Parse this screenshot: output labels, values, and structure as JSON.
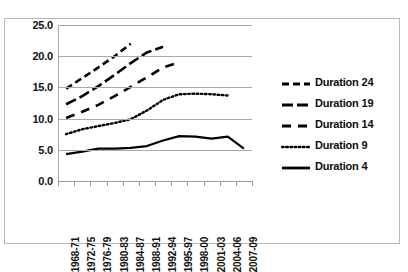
{
  "chart_data": {
    "type": "line",
    "title": "",
    "xlabel": "",
    "ylabel": "",
    "ylim": [
      0.0,
      25.0
    ],
    "ytick_labels": [
      "25.0",
      "20.0",
      "15.0",
      "10.0",
      "5.0",
      "0.0"
    ],
    "ytick_values": [
      25.0,
      20.0,
      15.0,
      10.0,
      5.0,
      0.0
    ],
    "grid": true,
    "legend_position": "right",
    "categories": [
      "1968-71",
      "1972-75",
      "1976-79",
      "1980-83",
      "1984-87",
      "1988-91",
      "1992-94",
      "1995-97",
      "1998-00",
      "2001-03",
      "2004-06",
      "2007-09"
    ],
    "series": [
      {
        "name": "Duration 24",
        "style": "short-dash",
        "values": [
          14.8,
          16.5,
          18.2,
          20.0,
          22.0,
          null,
          null,
          null,
          null,
          null,
          null,
          null
        ]
      },
      {
        "name": "Duration 19",
        "style": "long-dash",
        "values": [
          12.3,
          13.6,
          15.2,
          17.0,
          18.9,
          20.6,
          21.5,
          null,
          null,
          null,
          null,
          null
        ]
      },
      {
        "name": "Duration 14",
        "style": "dash",
        "values": [
          10.1,
          11.1,
          12.2,
          13.6,
          15.1,
          16.6,
          18.2,
          19.0,
          null,
          null,
          null,
          null
        ]
      },
      {
        "name": "Duration 9",
        "style": "dotted",
        "values": [
          7.5,
          8.3,
          8.8,
          9.3,
          9.9,
          11.3,
          13.0,
          13.9,
          14.0,
          13.9,
          13.7,
          null
        ]
      },
      {
        "name": "Duration 4",
        "style": "solid",
        "values": [
          4.3,
          4.7,
          5.2,
          5.2,
          5.3,
          5.6,
          6.5,
          7.2,
          7.1,
          6.8,
          7.1,
          5.2
        ]
      }
    ]
  },
  "legend": {
    "items": [
      {
        "label": "Duration 24"
      },
      {
        "label": "Duration 19"
      },
      {
        "label": "Duration 14"
      },
      {
        "label": "Duration 9"
      },
      {
        "label": "Duration 4"
      }
    ]
  },
  "colors": {
    "line": "#000000",
    "grid": "#a9a9a9",
    "border": "#b8b8b8",
    "background": "#ffffff",
    "text": "#111111"
  }
}
